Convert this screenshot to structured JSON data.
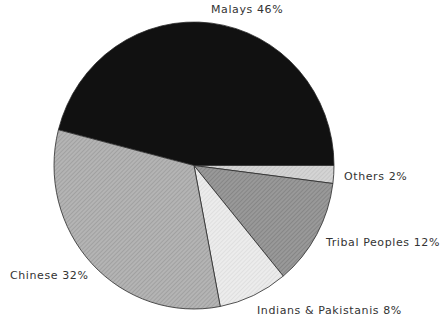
{
  "chart_data": {
    "type": "pie",
    "title": "",
    "start_angle_deg": 0,
    "direction": "malays-counterclockwise-others-clockwise",
    "slices": [
      {
        "label": "Malays",
        "value": 46,
        "display": "Malays 46%",
        "color": "#111111",
        "pattern": "solid"
      },
      {
        "label": "Others",
        "value": 2,
        "display": "Others 2%",
        "color": "#c9c9c9",
        "pattern": "hatch"
      },
      {
        "label": "Tribal Peoples",
        "value": 12,
        "display": "Tribal Peoples 12%",
        "color": "#8c8c8c",
        "pattern": "hatch"
      },
      {
        "label": "Indians & Pakistanis",
        "value": 8,
        "display": "Indians & Pakistanis 8%",
        "color": "#e2e2e2",
        "pattern": "hatch"
      },
      {
        "label": "Chinese",
        "value": 32,
        "display": "Chinese 32%",
        "color": "#a9a9a9",
        "pattern": "hatch"
      }
    ],
    "legend": "none (labels placed around slices)"
  },
  "labels": {
    "malays": "Malays 46%",
    "others": "Others 2%",
    "tribal": "Tribal Peoples 12%",
    "indians": "Indians & Pakistanis 8%",
    "chinese": "Chinese 32%"
  }
}
